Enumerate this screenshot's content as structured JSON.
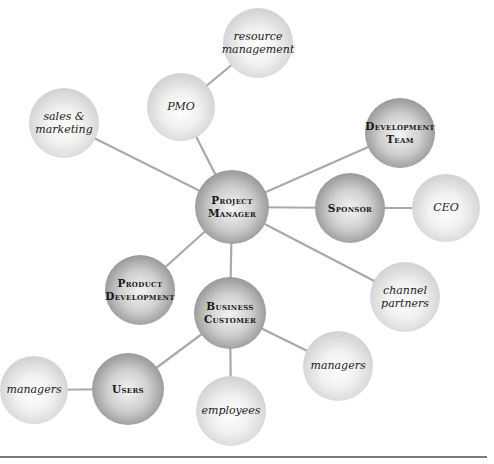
{
  "diagram": {
    "type": "stakeholder-map",
    "center": "project_manager",
    "nodes": [
      {
        "id": "project_manager",
        "label_lines": [
          "Project",
          "Manager"
        ],
        "style": "dark",
        "font": "caps",
        "cx": 232,
        "cy": 207,
        "r": 37
      },
      {
        "id": "development_team",
        "label_lines": [
          "Development",
          "Team"
        ],
        "style": "dark",
        "font": "caps",
        "cx": 400,
        "cy": 133,
        "r": 35
      },
      {
        "id": "sponsor",
        "label_lines": [
          "Sponsor"
        ],
        "style": "dark",
        "font": "caps",
        "cx": 350,
        "cy": 208,
        "r": 35
      },
      {
        "id": "ceo",
        "label_lines": [
          "CEO"
        ],
        "style": "light",
        "font": "italic",
        "cx": 446,
        "cy": 208,
        "r": 34
      },
      {
        "id": "resource_management",
        "label_lines": [
          "resource",
          "management"
        ],
        "style": "light",
        "font": "italic",
        "cx": 258,
        "cy": 43,
        "r": 35
      },
      {
        "id": "pmo",
        "label_lines": [
          "PMO"
        ],
        "style": "light",
        "font": "italic",
        "cx": 181,
        "cy": 107,
        "r": 34
      },
      {
        "id": "sales_marketing",
        "label_lines": [
          "sales &",
          "marketing"
        ],
        "style": "light",
        "font": "italic",
        "cx": 64,
        "cy": 123,
        "r": 35
      },
      {
        "id": "channel_partners",
        "label_lines": [
          "channel",
          "partners"
        ],
        "style": "light",
        "font": "italic",
        "cx": 405,
        "cy": 297,
        "r": 35
      },
      {
        "id": "product_development",
        "label_lines": [
          "Product",
          "Development"
        ],
        "style": "dark",
        "font": "caps",
        "cx": 140,
        "cy": 290,
        "r": 35
      },
      {
        "id": "business_customer",
        "label_lines": [
          "Business",
          "Customer"
        ],
        "style": "dark",
        "font": "caps",
        "cx": 230,
        "cy": 313,
        "r": 36
      },
      {
        "id": "managers_right",
        "label_lines": [
          "managers"
        ],
        "style": "light",
        "font": "italic",
        "cx": 338,
        "cy": 366,
        "r": 35
      },
      {
        "id": "employees",
        "label_lines": [
          "employees"
        ],
        "style": "light",
        "font": "italic",
        "cx": 231,
        "cy": 411,
        "r": 35
      },
      {
        "id": "users",
        "label_lines": [
          "Users"
        ],
        "style": "dark",
        "font": "caps",
        "cx": 128,
        "cy": 389,
        "r": 36
      },
      {
        "id": "managers_left",
        "label_lines": [
          "managers"
        ],
        "style": "light",
        "font": "italic",
        "cx": 34,
        "cy": 390,
        "r": 34
      }
    ],
    "edges": [
      [
        "project_manager",
        "development_team"
      ],
      [
        "project_manager",
        "sponsor"
      ],
      [
        "sponsor",
        "ceo"
      ],
      [
        "project_manager",
        "pmo"
      ],
      [
        "pmo",
        "resource_management"
      ],
      [
        "project_manager",
        "sales_marketing"
      ],
      [
        "project_manager",
        "channel_partners"
      ],
      [
        "project_manager",
        "product_development"
      ],
      [
        "project_manager",
        "business_customer"
      ],
      [
        "business_customer",
        "managers_right"
      ],
      [
        "business_customer",
        "employees"
      ],
      [
        "business_customer",
        "users"
      ],
      [
        "users",
        "managers_left"
      ]
    ],
    "colors": {
      "edge": "#a9a9a9",
      "rule": "#7a7a7a",
      "text": "#1a1a1a"
    }
  }
}
